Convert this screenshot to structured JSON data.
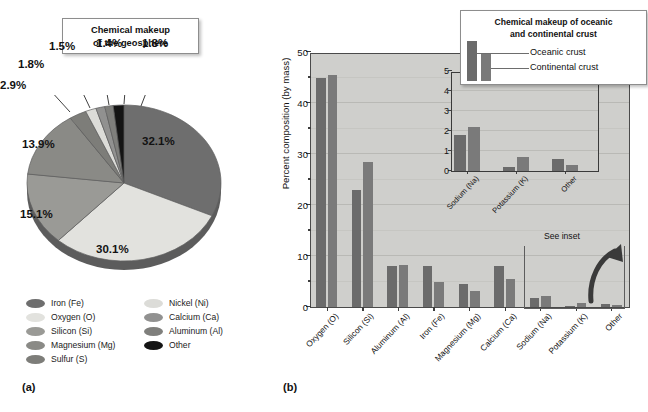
{
  "panel_a": {
    "label": "(a)",
    "title": "Chemical makeup\nof the geosphere",
    "title_line1": "Chemical makeup",
    "title_line2": "of the geosphere",
    "pie_labels": [
      "32.1%",
      "30.1%",
      "15.1%",
      "13.9%",
      "2.9%",
      "1.8%",
      "1.5%",
      "1.4%",
      "1.8%"
    ],
    "legend": {
      "column1": [
        {
          "label": "Iron (Fe)",
          "color": "#6e6e6e"
        },
        {
          "label": "Oxygen (O)",
          "color": "#e2e2de"
        },
        {
          "label": "Silicon (Si)",
          "color": "#9a9a96"
        },
        {
          "label": "Magnesium (Mg)",
          "color": "#8a8a86"
        },
        {
          "label": "Sulfur (S)",
          "color": "#7d7d79"
        }
      ],
      "column2": [
        {
          "label": "Nickel (Ni)",
          "color": "#dcdcd8"
        },
        {
          "label": "Calcium (Ca)",
          "color": "#919190"
        },
        {
          "label": "Aluminum (Al)",
          "color": "#7f7f7c"
        },
        {
          "label": "Other",
          "color": "#141414"
        }
      ]
    }
  },
  "panel_b": {
    "label": "(b)",
    "title_line1": "Chemical makeup of  oceanic",
    "title_line2": "and continental crust",
    "key": {
      "oceanic": "Oceanic crust",
      "continental": "Continental crust"
    },
    "see_inset": "See inset"
  },
  "chart_data": [
    {
      "type": "pie",
      "title": "Chemical makeup of the geosphere",
      "panel": "(a)",
      "labels": [
        "Iron (Fe)",
        "Oxygen (O)",
        "Silicon (Si)",
        "Magnesium (Mg)",
        "Sulfur (S)",
        "Nickel (Ni)",
        "Calcium (Ca)",
        "Aluminum (Al)",
        "Other"
      ],
      "values": [
        32.1,
        30.1,
        15.1,
        13.9,
        2.9,
        1.8,
        1.5,
        1.4,
        1.8
      ],
      "value_labels": [
        "32.1%",
        "30.1%",
        "15.1%",
        "13.9%",
        "2.9%",
        "1.8%",
        "1.5%",
        "1.4%",
        "1.8%"
      ],
      "colors": [
        "#6e6e6e",
        "#e2e2de",
        "#9a9a96",
        "#8a8a86",
        "#7d7d79",
        "#dcdcd8",
        "#919190",
        "#7f7f7c",
        "#141414"
      ],
      "legend_position": "bottom"
    },
    {
      "type": "bar",
      "title": "Chemical makeup of  oceanic and continental crust",
      "panel": "(b)",
      "ylabel": "Percent composition (by mass)",
      "xlabel": "",
      "ylim": [
        0,
        50
      ],
      "yticks": [
        0,
        10,
        20,
        30,
        40,
        50
      ],
      "yminor": [
        5,
        15,
        25,
        35,
        45
      ],
      "grid": true,
      "legend_position": "top-right",
      "categories": [
        "Oxygen (O)",
        "Silicon (Si)",
        "Aluminum (Al)",
        "Iron (Fe)",
        "Magnesium (Mg)",
        "Calcium (Ca)",
        "Sodium (Na)",
        "Potassium (K)",
        "Other"
      ],
      "series": [
        {
          "name": "Oceanic crust",
          "values": [
            45.0,
            23.0,
            8.0,
            8.0,
            4.5,
            8.0,
            1.8,
            0.2,
            0.6
          ]
        },
        {
          "name": "Continental crust",
          "values": [
            45.5,
            28.5,
            8.2,
            5.0,
            3.2,
            5.4,
            2.2,
            0.7,
            0.3
          ]
        }
      ],
      "annotations": [
        "See inset"
      ],
      "inset": {
        "type": "bar",
        "ylim": [
          0,
          5
        ],
        "yticks": [
          0,
          1,
          2,
          3,
          4,
          5
        ],
        "grid": true,
        "categories": [
          "Sodium (Na)",
          "Potassium (K)",
          "Other"
        ],
        "series": [
          {
            "name": "Oceanic crust",
            "values": [
              1.8,
              0.2,
              0.6
            ]
          },
          {
            "name": "Continental crust",
            "values": [
              2.2,
              0.7,
              0.3
            ]
          }
        ]
      }
    }
  ]
}
